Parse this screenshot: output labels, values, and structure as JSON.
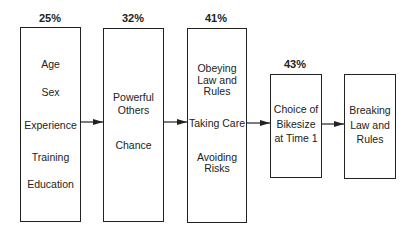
{
  "diagram": {
    "type": "path-model",
    "boxes": [
      {
        "id": "b1",
        "percent": "25%",
        "items": [
          "Age",
          "Sex",
          "Experience",
          "Training",
          "Education"
        ]
      },
      {
        "id": "b2",
        "percent": "32%",
        "items": [
          "Powerful Others",
          "Chance"
        ]
      },
      {
        "id": "b3",
        "percent": "41%",
        "items": [
          "Obeying Law and Rules",
          "Taking Care",
          "Avoiding Risks"
        ]
      },
      {
        "id": "b4",
        "percent": "43%",
        "items": [
          "Choice of Bikesize at Time 1"
        ]
      },
      {
        "id": "b5",
        "percent": "",
        "items": [
          "Breaking Law and Rules"
        ]
      }
    ],
    "arrows": [
      {
        "from": "b1",
        "to": "b2"
      },
      {
        "from": "b2",
        "to": "b3"
      },
      {
        "from": "b3",
        "to": "b4"
      },
      {
        "from": "b4",
        "to": "b5"
      }
    ]
  },
  "text": {
    "b1_pct": "25%",
    "b1_age": "Age",
    "b1_sex": "Sex",
    "b1_experience": "Experience",
    "b1_training": "Training",
    "b1_education": "Education",
    "b2_pct": "32%",
    "b2_powerful_l1": "Powerful",
    "b2_powerful_l2": "Others",
    "b2_chance": "Chance",
    "b3_pct": "41%",
    "b3_obey_l1": "Obeying",
    "b3_obey_l2": "Law and",
    "b3_obey_l3": "Rules",
    "b3_care": "Taking Care",
    "b3_avoid_l1": "Avoiding",
    "b3_avoid_l2": "Risks",
    "b4_pct": "43%",
    "b4_l1": "Choice of",
    "b4_l2": "Bikesize",
    "b4_l3": "at Time 1",
    "b5_l1": "Breaking",
    "b5_l2": "Law and",
    "b5_l3": "Rules"
  }
}
